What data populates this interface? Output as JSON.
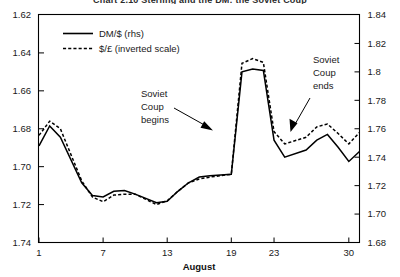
{
  "figure": {
    "title_clipped": "Chart 2.10  Sterling and the DM: the Soviet Coup",
    "width": 400,
    "height": 277
  },
  "chart_data": {
    "type": "line",
    "title": "Chart 2.10  Sterling and the DM: the Soviet Coup",
    "xlabel": "August",
    "ylabel": "",
    "grid": false,
    "legend_position": "top-left",
    "x_tick_labels": [
      "1",
      "7",
      "13",
      "19",
      "23",
      "30"
    ],
    "x_tick_values": [
      1,
      7,
      13,
      19,
      23,
      30
    ],
    "xlim": [
      1,
      31
    ],
    "left_axis": {
      "label": "$/£ (inverted scale)",
      "inverted": true,
      "ylim": [
        1.62,
        1.74
      ],
      "ticks": [
        "1.62",
        "1.64",
        "1.66",
        "1.68",
        "1.70",
        "1.72",
        "1.74"
      ],
      "tick_values": [
        1.62,
        1.64,
        1.66,
        1.68,
        1.7,
        1.72,
        1.74
      ]
    },
    "right_axis": {
      "label": "DM/$ (rhs)",
      "inverted": false,
      "ylim": [
        1.68,
        1.84
      ],
      "ticks": [
        "1.84",
        "1.82",
        "1.8",
        "1.78",
        "1.76",
        "1.74",
        "1.72",
        "1.70",
        "1.68"
      ],
      "tick_values": [
        1.84,
        1.82,
        1.8,
        1.78,
        1.76,
        1.74,
        1.72,
        1.7,
        1.68
      ]
    },
    "series": [
      {
        "name": "DM/$ (rhs)",
        "style": "solid",
        "axis": "right",
        "x": [
          1,
          2,
          3,
          5,
          6,
          7,
          8,
          9,
          10,
          12,
          13,
          14,
          15,
          16,
          17,
          19,
          20,
          21,
          22,
          23,
          24,
          26,
          27,
          28,
          29,
          30,
          31
        ],
        "values": [
          1.748,
          1.762,
          1.754,
          1.722,
          1.713,
          1.712,
          1.716,
          1.7165,
          1.714,
          1.708,
          1.709,
          1.716,
          1.722,
          1.726,
          1.727,
          1.728,
          1.8,
          1.802,
          1.801,
          1.752,
          1.74,
          1.745,
          1.752,
          1.756,
          1.747,
          1.737,
          1.744
        ]
      },
      {
        "name": "$/£ (inverted scale)",
        "style": "dotted",
        "axis": "left",
        "x": [
          1,
          2,
          3,
          5,
          6,
          7,
          8,
          9,
          10,
          12,
          13,
          14,
          15,
          16,
          17,
          19,
          20,
          21,
          22,
          23,
          24,
          26,
          27,
          28,
          29,
          30,
          31
        ],
        "values": [
          1.6835,
          1.676,
          1.68,
          1.7075,
          1.716,
          1.7185,
          1.715,
          1.7145,
          1.7145,
          1.72,
          1.718,
          1.713,
          1.7085,
          1.7065,
          1.7055,
          1.704,
          1.6455,
          1.643,
          1.645,
          1.6815,
          1.688,
          1.6845,
          1.679,
          1.6775,
          1.6825,
          1.688,
          1.682
        ]
      }
    ],
    "annotations": [
      {
        "text_lines": [
          "Soviet",
          "Coup",
          "begins"
        ],
        "text_x": 10.8,
        "arrow_from_x": 13.9,
        "arrow_to_x": 18.0,
        "event_day": 19
      },
      {
        "text_lines": [
          "Soviet",
          "Coup",
          "ends"
        ],
        "text_x": 24.5,
        "arrow_from_x": 25.6,
        "arrow_to_x": 23.4,
        "event_day": 22
      }
    ]
  },
  "legend": {
    "items": [
      {
        "label": "DM/$ (rhs)",
        "style": "solid"
      },
      {
        "label": "$/£ (inverted scale)",
        "style": "dotted"
      }
    ]
  }
}
